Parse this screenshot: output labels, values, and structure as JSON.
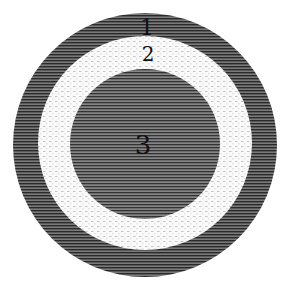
{
  "figure": {
    "layers": [
      {
        "id": "layer-1",
        "label": "1",
        "shade": "dark",
        "color": "#5a5a5a"
      },
      {
        "id": "layer-2",
        "label": "2",
        "shade": "light",
        "color": "#f4f4f4"
      },
      {
        "id": "layer-3",
        "label": "3",
        "shade": "dark",
        "color": "#5e5e5e"
      }
    ],
    "background": "#ffffff",
    "label_color": "#111111"
  }
}
